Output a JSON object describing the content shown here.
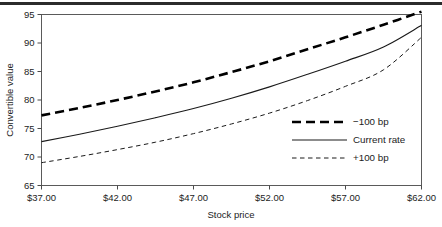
{
  "figure": {
    "background_color": "#ffffff",
    "top_rule_color": "#2b2b2b"
  },
  "chart_data": {
    "type": "line",
    "title": "",
    "subtitle": "",
    "xlabel": "Stock price",
    "ylabel": "Convertible value",
    "xlim": [
      37.0,
      62.0
    ],
    "ylim": [
      65,
      95
    ],
    "grid": false,
    "legend_position": "center-right",
    "x_tick_labels": [
      "$37.00",
      "$42.00",
      "$47.00",
      "$52.00",
      "$57.00",
      "$62.00"
    ],
    "x_tick_values": [
      37.0,
      42.0,
      47.0,
      52.0,
      57.0,
      62.0
    ],
    "y_tick_labels": [
      "65",
      "70",
      "75",
      "80",
      "85",
      "90",
      "95"
    ],
    "y_tick_values": [
      65,
      70,
      75,
      80,
      85,
      90,
      95
    ],
    "x": [
      37.0,
      39.5,
      42.0,
      44.5,
      47.0,
      49.5,
      52.0,
      54.5,
      57.0,
      59.5,
      62.0
    ],
    "series": [
      {
        "name": "−100 bp",
        "style": "bold-dashed",
        "values": [
          77.3,
          78.6,
          80.0,
          81.5,
          83.1,
          84.9,
          86.8,
          88.9,
          91.0,
          93.2,
          95.5
        ]
      },
      {
        "name": "Current rate",
        "style": "solid",
        "values": [
          72.7,
          74.0,
          75.4,
          76.9,
          78.5,
          80.3,
          82.3,
          84.5,
          86.8,
          89.3,
          93.1
        ]
      },
      {
        "name": "+100 bp",
        "style": "fine-dashed",
        "values": [
          69.0,
          70.1,
          71.3,
          72.6,
          74.1,
          75.8,
          77.7,
          79.9,
          82.4,
          85.3,
          91.0
        ]
      }
    ]
  },
  "legend": {
    "entries": [
      {
        "label": "−100 bp",
        "style": "bold-dashed"
      },
      {
        "label": "Current rate",
        "style": "solid"
      },
      {
        "label": "+100 bp",
        "style": "fine-dashed"
      }
    ]
  }
}
